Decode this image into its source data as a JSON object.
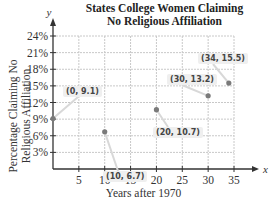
{
  "chart_data": {
    "type": "scatter",
    "title": "States College Women Claiming No Religious Affiliation",
    "title_lines": [
      "States College Women Claiming",
      "No Religious Affiliation"
    ],
    "xlabel": "Years after 1970",
    "ylabel": "Percentage Claiming No Religious Affiliation",
    "ylabel_lines": [
      "Percentage Claiming No",
      "Religious Affiliation"
    ],
    "x_axis_letter": "x",
    "y_axis_letter": "y",
    "xlim": [
      0,
      35
    ],
    "ylim": [
      0,
      24
    ],
    "x_ticks": [
      5,
      10,
      15,
      20,
      25,
      30,
      35
    ],
    "x_tick_labels": [
      "5",
      "10",
      "15",
      "20",
      "25",
      "30",
      "35"
    ],
    "y_ticks": [
      3,
      6,
      9,
      12,
      15,
      18,
      21,
      24
    ],
    "y_tick_labels": [
      "3%",
      "6%",
      "9%",
      "12%",
      "15%",
      "18%",
      "21%",
      "24%"
    ],
    "grid": true,
    "points": [
      {
        "x": 0,
        "y": 9.1,
        "label": "(0, 9.1)"
      },
      {
        "x": 10,
        "y": 6.7,
        "label": "(10, 6.7)"
      },
      {
        "x": 20,
        "y": 10.7,
        "label": "(20, 10.7)"
      },
      {
        "x": 30,
        "y": 13.2,
        "label": "(30, 13.2)"
      },
      {
        "x": 34,
        "y": 15.5,
        "label": "(34, 15.5)"
      }
    ],
    "colors": {
      "point": "#7a7a7a",
      "grid": "#c8c8c8",
      "axis": "#333333",
      "callout_bg": "#efefef"
    }
  }
}
